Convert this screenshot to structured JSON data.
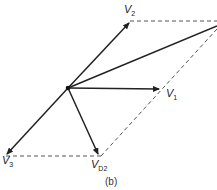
{
  "diagram": {
    "caption": "(b)",
    "origin": {
      "x": 68,
      "y": 88
    },
    "vectors": [
      {
        "id": "v1",
        "label": "V",
        "sub": "1",
        "to": {
          "x": 160,
          "y": 89
        }
      },
      {
        "id": "v2",
        "label": "V",
        "sub": "2",
        "to": {
          "x": 130,
          "y": 22
        }
      },
      {
        "id": "v3",
        "label": "V",
        "sub": "3",
        "to": {
          "x": 6,
          "y": 155
        }
      },
      {
        "id": "vd2",
        "label": "V",
        "sub": "D2",
        "to": {
          "x": 99,
          "y": 155
        }
      },
      {
        "id": "resultant",
        "label": "",
        "sub": "",
        "to": {
          "x": 217,
          "y": 26
        }
      }
    ],
    "dashed_lines": [
      {
        "from": {
          "x": 130,
          "y": 21
        },
        "to": {
          "x": 217,
          "y": 21
        }
      },
      {
        "from": {
          "x": 6,
          "y": 156
        },
        "to": {
          "x": 101,
          "y": 156
        }
      },
      {
        "from": {
          "x": 101,
          "y": 156
        },
        "to": {
          "x": 217,
          "y": 29
        }
      }
    ]
  }
}
